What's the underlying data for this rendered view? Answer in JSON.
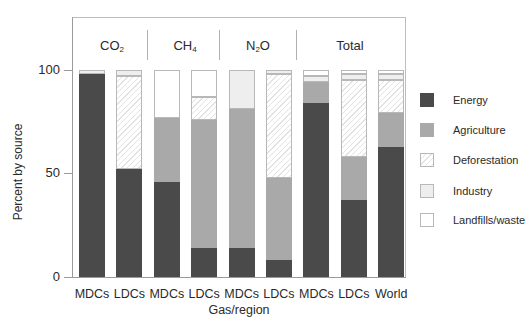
{
  "chart_data": {
    "type": "bar",
    "stacked": true,
    "title": "",
    "xlabel": "Gas/region",
    "ylabel": "Percent by source",
    "ylim": [
      0,
      100
    ],
    "yticks": [
      0,
      50,
      100
    ],
    "grid": false,
    "legend_position": "right",
    "groups": [
      {
        "label": "CO2",
        "categories": [
          "MDCs",
          "LDCs"
        ]
      },
      {
        "label": "CH4",
        "categories": [
          "MDCs",
          "LDCs"
        ]
      },
      {
        "label": "N2O",
        "categories": [
          "MDCs",
          "LDCs"
        ]
      },
      {
        "label": "Total",
        "categories": [
          "MDCs",
          "LDCs",
          "World"
        ]
      }
    ],
    "categories": [
      "CO2 MDCs",
      "CO2 LDCs",
      "CH4 MDCs",
      "CH4 LDCs",
      "N2O MDCs",
      "N2O LDCs",
      "Total MDCs",
      "Total LDCs",
      "Total World"
    ],
    "series": [
      {
        "name": "Energy",
        "values": [
          98,
          52,
          46,
          14,
          14,
          8,
          84,
          37,
          63
        ]
      },
      {
        "name": "Agriculture",
        "values": [
          0,
          0,
          31,
          62,
          67,
          40,
          10,
          21,
          16
        ]
      },
      {
        "name": "Deforestation",
        "values": [
          0,
          45,
          0,
          11,
          0,
          50,
          0,
          37,
          16
        ]
      },
      {
        "name": "Industry",
        "values": [
          2,
          3,
          0,
          0,
          19,
          2,
          3,
          3,
          3
        ]
      },
      {
        "name": "Landfills/waste",
        "values": [
          0,
          0,
          23,
          13,
          0,
          0,
          3,
          2,
          2
        ]
      }
    ]
  },
  "axis": {
    "ylabel": "Percent by source",
    "xlabel": "Gas/region",
    "ticks": [
      {
        "label": "100",
        "value": 100
      },
      {
        "label": "50",
        "value": 50
      },
      {
        "label": "0",
        "value": 0
      }
    ]
  },
  "groups": {
    "co2": {
      "main": "CO",
      "sub": "2"
    },
    "ch4": {
      "main": "CH",
      "sub": "4"
    },
    "n2o": {
      "pre": "N",
      "sub": "2",
      "post": "O"
    },
    "total": {
      "main": "Total"
    }
  },
  "category_labels": [
    "MDCs",
    "LDCs",
    "MDCs",
    "LDCs",
    "MDCs",
    "LDCs",
    "MDCs",
    "LDCs",
    "World"
  ],
  "legend": [
    {
      "label": "Energy",
      "key": "energy"
    },
    {
      "label": "Agriculture",
      "key": "agriculture"
    },
    {
      "label": "Deforestation",
      "key": "deforestation"
    },
    {
      "label": "Industry",
      "key": "industry"
    },
    {
      "label": "Landfills/waste",
      "key": "landfills"
    }
  ]
}
